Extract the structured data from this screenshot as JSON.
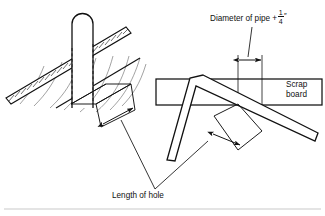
{
  "figure": {
    "background_color": "#ffffff",
    "line_color": "#111111",
    "rule_color": "#c9c9c9",
    "width": 325,
    "height": 216
  },
  "labels": {
    "diameter": {
      "prefix": "Diameter of pipe +",
      "fraction_numerator": "1",
      "fraction_denominator": "4",
      "unit_mark": "″"
    },
    "scrap_board": {
      "line1": "Scrap",
      "line2": "board"
    },
    "length_of_hole": "Length of hole"
  },
  "left_figure": {
    "name": "roof-deck-with-pipe",
    "parts": [
      "hatched-roof-deck",
      "vertical-pipe",
      "hole-outline",
      "hidden-edge-dashed-lines",
      "shingle-curves",
      "length-dimension-arrow"
    ]
  },
  "right_figure": {
    "name": "framing-square-on-scrap-board",
    "parts": [
      "scrap-board-rectangle",
      "framing-square",
      "diameter-dimension-arrow",
      "diameter-extension-lines",
      "length-dimension-arrow"
    ]
  },
  "leaders": {
    "diameter_leader": "from label down to diameter dimension arrow",
    "length_leader_left": "from Length of hole text to left figure hole arrow",
    "length_leader_right": "from Length of hole text to right figure hole arrow"
  }
}
